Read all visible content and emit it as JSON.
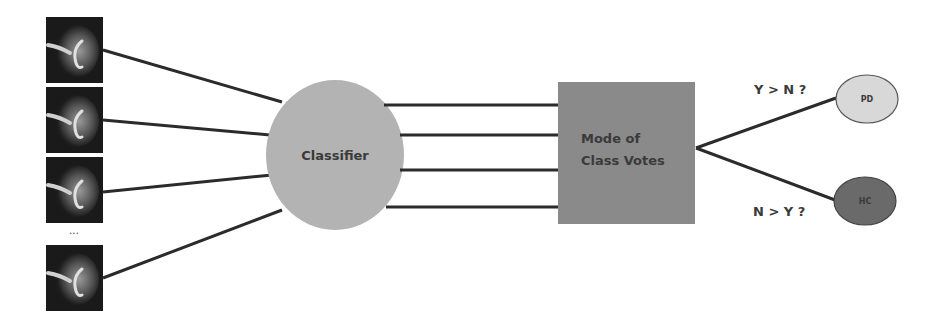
{
  "diagram": {
    "inputs": {
      "count_shown": 4,
      "ellipsis": "...",
      "thumbnail_kind": "brain-scan-slice"
    },
    "classifier": {
      "label": "Classifier",
      "color": "#b3b3b3"
    },
    "aggregator": {
      "label_line1": "Mode of",
      "label_line2": "Class Votes",
      "color": "#8a8a8a"
    },
    "branches": [
      {
        "condition": "Y > N ?",
        "outcome": "PD",
        "color": "#d8d8d8"
      },
      {
        "condition": "N > Y ?",
        "outcome": "HC",
        "color": "#6a6a6a"
      }
    ],
    "line_color": "#2b2b2b"
  }
}
